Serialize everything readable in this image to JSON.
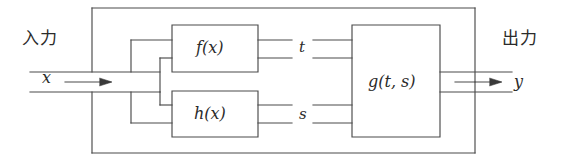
{
  "diagram": {
    "type": "signal-flow block diagram",
    "stroke_color": "#4a4a4a",
    "background": "#ffffff",
    "labels": {
      "input_jp": "入力",
      "output_jp": "出力",
      "input_signal": "x",
      "output_signal": "y",
      "intermediate_top": "t",
      "intermediate_bottom": "s"
    },
    "blocks": [
      {
        "id": "f",
        "label": "f(x)",
        "role": "top-branch-function"
      },
      {
        "id": "h",
        "label": "h(x)",
        "role": "bottom-branch-function"
      },
      {
        "id": "g",
        "label": "g(t, s)",
        "role": "combining-function"
      }
    ],
    "connections": [
      {
        "from": "x",
        "to": "f",
        "label": "x"
      },
      {
        "from": "x",
        "to": "h",
        "label": "x"
      },
      {
        "from": "f",
        "to": "g",
        "label": "t"
      },
      {
        "from": "h",
        "to": "g",
        "label": "s"
      },
      {
        "from": "g",
        "to": "y",
        "label": "y"
      }
    ],
    "arrows": [
      {
        "name": "input-arrow",
        "direction": "right"
      },
      {
        "name": "output-arrow",
        "direction": "right"
      }
    ]
  }
}
